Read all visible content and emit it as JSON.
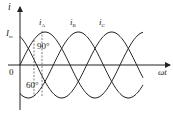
{
  "diagram": {
    "type": "three-phase sinusoidal current waveforms",
    "axis": {
      "y_label": "i",
      "x_label": "ωt",
      "origin_label": "0",
      "amplitude_label": "I",
      "amplitude_sub": "m"
    },
    "curves": [
      {
        "name": "i",
        "sub": "A",
        "phase_deg": 0
      },
      {
        "name": "i",
        "sub": "B",
        "phase_deg": -120
      },
      {
        "name": "i",
        "sub": "C",
        "phase_deg": 120
      }
    ],
    "annotations": {
      "angle_top": "90°",
      "angle_bottom": "60°"
    }
  }
}
